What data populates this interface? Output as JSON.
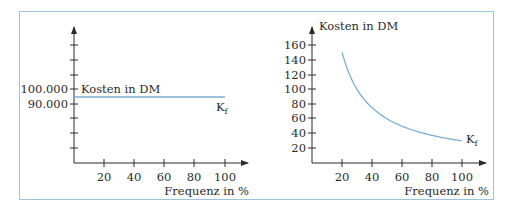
{
  "chart_data": [
    {
      "type": "line",
      "title": "",
      "xlabel": "Frequenz in %",
      "ylabel": "Kosten in DM",
      "x_ticks": [
        20,
        40,
        60,
        80,
        100
      ],
      "y_tick_labels": [
        "100.000",
        "90.000"
      ],
      "y_tick_count": 8,
      "series": [
        {
          "name": "K_f",
          "x": [
            0,
            100
          ],
          "values": [
            95000,
            95000
          ]
        }
      ],
      "xlim": [
        0,
        110
      ],
      "grid": false,
      "series_color": "#7aaed6"
    },
    {
      "type": "line",
      "title": "",
      "xlabel": "Frequenz in %",
      "ylabel": "Kosten in DM",
      "x_ticks": [
        20,
        40,
        60,
        80,
        100
      ],
      "y_ticks": [
        20,
        40,
        60,
        80,
        100,
        120,
        140,
        160
      ],
      "series": [
        {
          "name": "K_f",
          "x": [
            20,
            30,
            40,
            50,
            60,
            70,
            80,
            90,
            100
          ],
          "values": [
            150,
            100,
            75,
            60,
            50,
            42.9,
            37.5,
            33.3,
            30
          ]
        }
      ],
      "xlim": [
        0,
        110
      ],
      "ylim": [
        0,
        180
      ],
      "grid": false,
      "series_color": "#7aaed6"
    }
  ],
  "left": {
    "ylabel": "Kosten in DM",
    "xlabel": "Frequenz in %",
    "y_label_100k": "100.000",
    "y_label_90k": "90.000",
    "x_ticks": [
      "20",
      "40",
      "60",
      "80",
      "100"
    ],
    "series_label": "K",
    "series_sub": "f"
  },
  "right": {
    "ylabel": "Kosten in DM",
    "xlabel": "Frequenz in %",
    "y_ticks": [
      "160",
      "140",
      "120",
      "100",
      "80",
      "60",
      "40",
      "20"
    ],
    "x_ticks": [
      "20",
      "40",
      "60",
      "80",
      "100"
    ],
    "series_label": "K",
    "series_sub": "f"
  }
}
